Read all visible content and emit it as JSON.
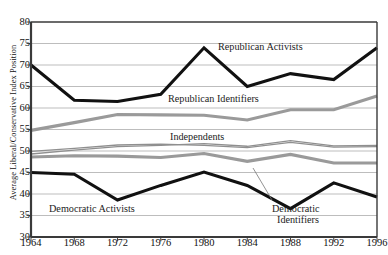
{
  "chart_data": {
    "type": "line",
    "title": "",
    "xlabel": "",
    "ylabel": "Average Liberal/Conservative Index Position",
    "x": [
      1964,
      1968,
      1972,
      1976,
      1980,
      1984,
      1988,
      1992,
      1996
    ],
    "xtick_labels": [
      "1964",
      "1968",
      "1972",
      "1976",
      "1980",
      "1984",
      "1988",
      "1992",
      "1996"
    ],
    "ytick_labels": [
      "80",
      "75",
      "70",
      "65",
      "60",
      "55",
      "50",
      "45",
      "40",
      "35",
      "30"
    ],
    "ylim": [
      30,
      80
    ],
    "xlim": [
      1964,
      1996
    ],
    "grid": "horizontal",
    "legend": "inline-annotations",
    "series": [
      {
        "name": "Republican Activists",
        "color": "#111111",
        "width": 3.1,
        "values": [
          70.0,
          61.8,
          61.5,
          63.2,
          74.0,
          65.0,
          68.0,
          66.6,
          74.0
        ]
      },
      {
        "name": "Republican Identifiers",
        "color": "#9a9a9a",
        "width": 3.1,
        "values": [
          54.8,
          56.6,
          58.5,
          58.4,
          58.3,
          57.2,
          59.6,
          59.6,
          62.8
        ]
      },
      {
        "name": "Independents",
        "color": "#8f8f8f",
        "width": 1.3,
        "values": [
          49.3,
          50.2,
          51.0,
          51.3,
          51.7,
          51.1,
          52.4,
          51.2,
          51.3
        ]
      },
      {
        "name": "Independents (second)",
        "color": "#8f8f8f",
        "width": 1.3,
        "values": [
          49.9,
          50.6,
          51.4,
          51.6,
          51.3,
          50.8,
          52.0,
          50.9,
          51.0
        ]
      },
      {
        "name": "Democratic Identifiers",
        "color": "#9a9a9a",
        "width": 3.1,
        "values": [
          48.6,
          48.9,
          48.8,
          48.5,
          49.4,
          47.6,
          49.2,
          47.2,
          47.2
        ]
      },
      {
        "name": "Democratic Activists",
        "color": "#111111",
        "width": 3.1,
        "values": [
          45.0,
          44.6,
          38.6,
          42.0,
          45.1,
          42.0,
          36.6,
          42.6,
          39.3
        ]
      }
    ],
    "annotations": [
      {
        "text": "Republican Activists",
        "x": 218,
        "y": 41
      },
      {
        "text": "Republican Identifiers",
        "x": 168,
        "y": 93
      },
      {
        "text": "Independents",
        "x": 170,
        "y": 131
      },
      {
        "text": "Democratic Activists",
        "x": 49,
        "y": 203
      },
      {
        "text": "Democratic",
        "x": 272,
        "y": 203
      },
      {
        "text": "Identifiers",
        "x": 277,
        "y": 214
      }
    ]
  }
}
